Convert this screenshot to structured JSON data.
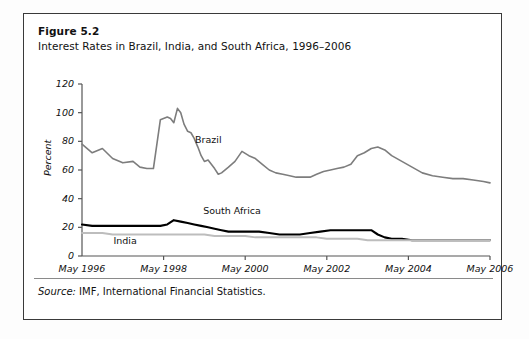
{
  "figure": {
    "title": "Figure 5.2",
    "subtitle": "Interest Rates in Brazil, India, and South Africa, 1996–2006",
    "source_prefix": "Source:",
    "source_text": " IMF, International Financial Statistics."
  },
  "colors": {
    "brazil": "#7d7d7d",
    "south_africa": "#000000",
    "india": "#bdbdbd",
    "axis": "#555555",
    "border": "#3a3a3a",
    "text": "#111111"
  },
  "chart_data": {
    "type": "line",
    "title": "Interest Rates in Brazil, India, and South Africa, 1996–2006",
    "xlabel": "",
    "ylabel": "Percent",
    "ylim": [
      0,
      120
    ],
    "ytick_values": [
      0,
      20,
      40,
      60,
      80,
      100,
      120
    ],
    "ytick_labels": [
      "0",
      "20",
      "40",
      "60",
      "80",
      "100",
      "120"
    ],
    "xtick_labels": [
      "May 1996",
      "May 1998",
      "May 2000",
      "May 2002",
      "May 2004",
      "May 2006"
    ],
    "xtick_years": [
      1996.33,
      1998.33,
      2000.33,
      2002.33,
      2004.33,
      2006.33
    ],
    "xlim": [
      1996.33,
      2006.33
    ],
    "grid": false,
    "legend": "inline-annotations",
    "annotations": [
      {
        "text": "Brazil",
        "x": 1999.1,
        "y": 80
      },
      {
        "text": "South Africa",
        "x": 1999.3,
        "y": 31
      },
      {
        "text": "India",
        "x": 1997.1,
        "y": 9.5
      }
    ],
    "series": [
      {
        "name": "Brazil",
        "color": "#7d7d7d",
        "x": [
          1996.33,
          1996.58,
          1996.83,
          1997.08,
          1997.33,
          1997.58,
          1997.75,
          1997.92,
          1998.08,
          1998.25,
          1998.42,
          1998.5,
          1998.58,
          1998.67,
          1998.75,
          1998.83,
          1998.92,
          1999.0,
          1999.08,
          1999.17,
          1999.25,
          1999.33,
          1999.42,
          1999.5,
          1999.58,
          1999.67,
          1999.75,
          1999.92,
          2000.08,
          2000.25,
          2000.42,
          2000.58,
          2000.75,
          2000.92,
          2001.08,
          2001.25,
          2001.42,
          2001.58,
          2001.75,
          2001.92,
          2002.08,
          2002.25,
          2002.42,
          2002.58,
          2002.75,
          2002.92,
          2003.08,
          2003.25,
          2003.42,
          2003.58,
          2003.75,
          2003.92,
          2004.17,
          2004.42,
          2004.67,
          2004.92,
          2005.17,
          2005.42,
          2005.67,
          2005.92,
          2006.17,
          2006.33
        ],
        "y": [
          78,
          72,
          75,
          68,
          65,
          66,
          62,
          61,
          61,
          95,
          97,
          96,
          93,
          103,
          100,
          92,
          87,
          86,
          82,
          76,
          70,
          66,
          67,
          64,
          61,
          57,
          58,
          62,
          66,
          73,
          70,
          68,
          64,
          60,
          58,
          57,
          56,
          55,
          55,
          55,
          57,
          59,
          60,
          61,
          62,
          64,
          70,
          72,
          75,
          76,
          74,
          70,
          66,
          62,
          58,
          56,
          55,
          54,
          54,
          53,
          52,
          51
        ]
      },
      {
        "name": "South Africa",
        "color": "#000000",
        "x": [
          1996.33,
          1996.58,
          1996.83,
          1997.08,
          1997.33,
          1997.58,
          1997.83,
          1998.08,
          1998.25,
          1998.42,
          1998.58,
          1998.75,
          1998.92,
          1999.08,
          1999.25,
          1999.42,
          1999.58,
          1999.75,
          1999.92,
          2000.17,
          2000.42,
          2000.67,
          2000.92,
          2001.17,
          2001.42,
          2001.67,
          2001.92,
          2002.17,
          2002.42,
          2002.67,
          2002.92,
          2003.17,
          2003.42,
          2003.58,
          2003.75,
          2003.92,
          2004.17,
          2004.42,
          2004.67,
          2004.92,
          2005.17,
          2005.42,
          2005.67,
          2005.92,
          2006.17,
          2006.33
        ],
        "y": [
          22,
          21,
          21,
          21,
          21,
          21,
          21,
          21,
          21,
          22,
          25,
          24,
          23,
          22,
          21,
          20,
          19,
          18,
          17,
          17,
          17,
          17,
          16,
          15,
          15,
          15,
          16,
          17,
          18,
          18,
          18,
          18,
          18,
          15,
          13,
          12,
          12,
          11,
          11,
          11,
          11,
          11,
          11,
          11,
          11,
          11
        ]
      },
      {
        "name": "India",
        "color": "#bdbdbd",
        "x": [
          1996.33,
          1996.58,
          1996.83,
          1997.08,
          1997.33,
          1997.58,
          1997.83,
          1998.08,
          1998.33,
          1998.58,
          1998.83,
          1999.08,
          1999.33,
          1999.58,
          1999.83,
          2000.08,
          2000.33,
          2000.58,
          2000.83,
          2001.08,
          2001.33,
          2001.58,
          2001.83,
          2002.08,
          2002.33,
          2002.58,
          2002.83,
          2003.08,
          2003.33,
          2003.58,
          2003.83,
          2004.08,
          2004.33,
          2004.58,
          2004.83,
          2005.08,
          2005.33,
          2005.58,
          2005.83,
          2006.08,
          2006.33
        ],
        "y": [
          16,
          16,
          16,
          15,
          15,
          15,
          15,
          15,
          15,
          15,
          15,
          15,
          15,
          14,
          14,
          14,
          14,
          13,
          13,
          13,
          13,
          13,
          13,
          13,
          12,
          12,
          12,
          12,
          11,
          11,
          11,
          11,
          11,
          11,
          11,
          11,
          11,
          11,
          11,
          11,
          11
        ]
      }
    ]
  }
}
